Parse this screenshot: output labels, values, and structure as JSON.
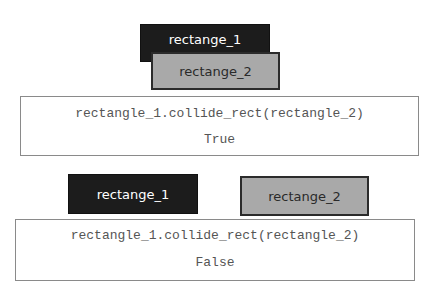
{
  "scenarios": [
    {
      "rect_1": {
        "label": "rectange_1",
        "color": "#1c1c1c"
      },
      "rect_2": {
        "label": "rectange_2",
        "color": "#a9a9a9"
      },
      "expression": "rectangle_1.collide_rect(rectangle_2)",
      "result": "True"
    },
    {
      "rect_1": {
        "label": "rectange_1",
        "color": "#1c1c1c"
      },
      "rect_2": {
        "label": "rectange_2",
        "color": "#a9a9a9"
      },
      "expression": "rectangle_1.collide_rect(rectangle_2)",
      "result": "False"
    }
  ]
}
